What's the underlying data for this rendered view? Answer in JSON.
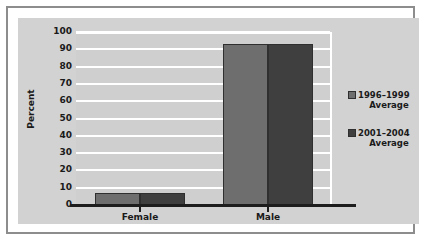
{
  "chart_data": {
    "type": "bar",
    "title": "",
    "subtitle": "",
    "xlabel": "",
    "ylabel": "Percent",
    "categories": [
      "Female",
      "Male"
    ],
    "series": [
      {
        "name": "1996–1999 Average",
        "values": [
          7,
          93
        ],
        "color": "#6e6e6e"
      },
      {
        "name": "2001–2004 Average",
        "values": [
          7,
          93
        ],
        "color": "#3f3f3f"
      }
    ],
    "ylim": [
      0,
      100
    ],
    "ytick_step": 10,
    "yticks": [
      100,
      90,
      80,
      70,
      60,
      50,
      40,
      30,
      20,
      10,
      0
    ],
    "grid": true,
    "grid_color": "#ffffff",
    "legend_position": "right",
    "orientation": "vertical",
    "grouping": "grouped",
    "plot_background": "#cfcfcf",
    "figure_background": "#d2d2d2",
    "axis_color": "#1d1d1d"
  },
  "legend": {
    "entries": [
      {
        "name_line1": "1996–1999",
        "name_line2": "Average",
        "swatch": "#6e6e6e"
      },
      {
        "name_line1": "2001–2004",
        "name_line2": "Average",
        "swatch": "#3f3f3f"
      }
    ]
  },
  "axes": {
    "y_title": "Percent",
    "y_ticks": [
      "100",
      "90",
      "80",
      "70",
      "60",
      "50",
      "40",
      "30",
      "20",
      "10",
      "0"
    ],
    "x_ticks": [
      "Female",
      "Male"
    ]
  }
}
